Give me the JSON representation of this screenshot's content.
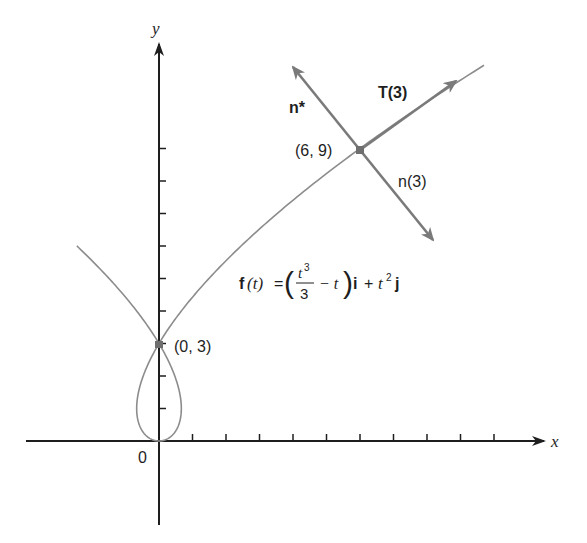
{
  "figure": {
    "curve_equation": {
      "f": "f",
      "lhs_arg": "(t)",
      "equals": "=",
      "frac_num": "t",
      "frac_num_exp": "3",
      "frac_den": "3",
      "minus_t": "−  t",
      "i": "i",
      "plus": "+",
      "t2": "t",
      "t2_exp": "2",
      "j": "j"
    },
    "axes": {
      "x_label": "x",
      "y_label": "y",
      "origin_label": "0",
      "x_ticks": [
        1,
        2,
        3,
        4,
        5,
        6,
        7,
        8,
        9,
        10
      ],
      "y_ticks": [
        1,
        2,
        3,
        4,
        5,
        6,
        7,
        8,
        9
      ]
    },
    "points": [
      {
        "label": "(0, 3)",
        "x": 0,
        "y": 3
      },
      {
        "label": "(6, 9)",
        "x": 6,
        "y": 9
      }
    ],
    "vectors": {
      "tangent_label": "T(3)",
      "normal_label": "n(3)",
      "normal_star_label": "n*"
    },
    "colors": {
      "axis": "#1e1e1e",
      "curve": "#8c8c8c",
      "vector": "#7a7a7a",
      "point": "#6e6e6e"
    }
  }
}
